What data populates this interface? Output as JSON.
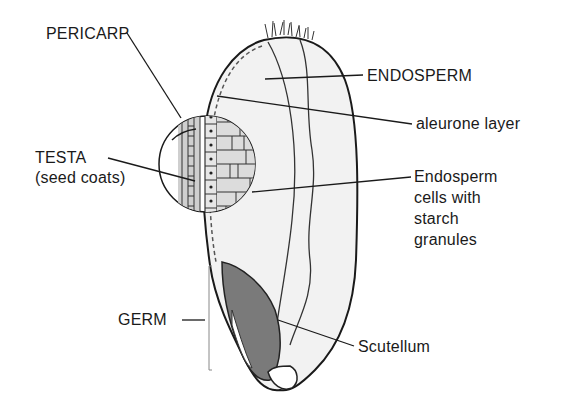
{
  "diagram": {
    "labels": {
      "pericarp": "PERICARP",
      "endosperm": "ENDOSPERM",
      "aleurone": "aleurone layer",
      "testa_line1": "TESTA",
      "testa_line2": "(seed coats)",
      "endosperm_cells_line1": "Endosperm",
      "endosperm_cells_line2": "cells with",
      "endosperm_cells_line3": "starch",
      "endosperm_cells_line4": "granules",
      "germ": "GERM",
      "scutellum": "Scutellum"
    },
    "colors": {
      "ink": "#1a1a1a",
      "endosperm_fill": "#f2f2f2",
      "germ_fill": "#7a7a7a",
      "cell_fill": "#d9d9d9",
      "background": "#ffffff"
    }
  }
}
